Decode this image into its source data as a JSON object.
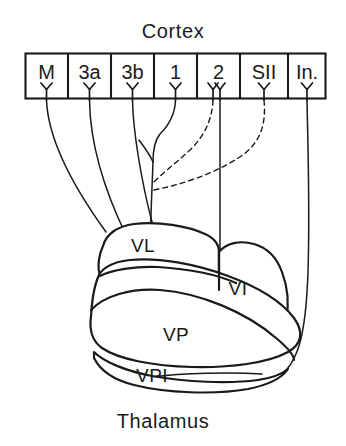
{
  "figure": {
    "width": 346,
    "height": 446,
    "background_color": "#ffffff",
    "ink_color": "#1a1a1a",
    "title_top": "Cortex",
    "title_bottom": "Thalamus"
  },
  "cortex": {
    "label": "Cortex",
    "areas": [
      {
        "id": "M",
        "label": "M",
        "neuron": "pyramidal-y-glyph",
        "neuron_count": 1
      },
      {
        "id": "3a",
        "label": "3a",
        "neuron": "pyramidal-y-glyph",
        "neuron_count": 1
      },
      {
        "id": "3b",
        "label": "3b",
        "neuron": "pyramidal-y-glyph",
        "neuron_count": 1
      },
      {
        "id": "1",
        "label": "1",
        "neuron": "pyramidal-y-glyph",
        "neuron_count": 1
      },
      {
        "id": "2",
        "label": "2",
        "neuron": "pyramidal-y-glyph",
        "neuron_count": 2
      },
      {
        "id": "SII",
        "label": "SII",
        "neuron": "pyramidal-y-glyph",
        "neuron_count": 1
      },
      {
        "id": "In.",
        "label": "In.",
        "neuron": "pyramidal-y-glyph",
        "neuron_count": 1
      }
    ]
  },
  "thalamus": {
    "label": "Thalamus",
    "nuclei": [
      {
        "id": "VL",
        "label": "VL"
      },
      {
        "id": "VI",
        "label": "VI"
      },
      {
        "id": "VP",
        "label": "VP"
      },
      {
        "id": "VPI",
        "label": "VPI"
      }
    ]
  },
  "connections": [
    {
      "from": "M",
      "to": "VL",
      "style": "solid"
    },
    {
      "from": "3a",
      "to": "VL",
      "style": "solid"
    },
    {
      "from": "3b",
      "to": "VP",
      "style": "solid"
    },
    {
      "from": "1",
      "to": "VP",
      "style": "solid"
    },
    {
      "from": "2",
      "to": "VI",
      "style": "solid"
    },
    {
      "from": "2",
      "to": "VP",
      "style": "dashed"
    },
    {
      "from": "SII",
      "to": "VP",
      "style": "dashed"
    },
    {
      "from": "In.",
      "to": "VPI",
      "style": "solid"
    },
    {
      "from": "VPI",
      "to": "In.",
      "style": "solid"
    }
  ]
}
